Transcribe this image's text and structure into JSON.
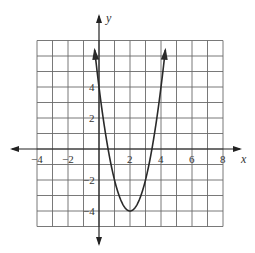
{
  "chart_data": {
    "type": "line",
    "title": "",
    "xlabel": "x",
    "ylabel": "y",
    "xlim": [
      -4,
      8
    ],
    "ylim": [
      -5,
      7
    ],
    "grid": true,
    "x_ticks": [
      -4,
      -2,
      2,
      4,
      6,
      8
    ],
    "y_ticks": [
      4,
      2,
      -2,
      -4
    ],
    "x_tick_labels": [
      "−4",
      "−2",
      "2",
      "4",
      "6",
      "8"
    ],
    "y_tick_labels": [
      "4",
      "2",
      "−2",
      "−4"
    ],
    "series": [
      {
        "name": "y = 2(x - 2)^2 - 4",
        "x": [
          0.15,
          0.5,
          1,
          1.5,
          2,
          2.5,
          3,
          3.5,
          3.85
        ],
        "values": [
          2.85,
          0.5,
          -2,
          -3.5,
          -4,
          -3.5,
          -2,
          0.5,
          2.85
        ],
        "vertex": [
          2,
          -4
        ],
        "y_intercept": 4,
        "passes_through": [
          [
            0,
            4
          ],
          [
            4,
            4
          ],
          [
            2,
            -4
          ]
        ],
        "color": "#333333"
      }
    ],
    "line_color": "#333333",
    "grid_color": "#555555"
  },
  "labels": {
    "x_axis": "x",
    "y_axis": "y",
    "xt0": "−4",
    "xt1": "−2",
    "xt2": "2",
    "xt3": "4",
    "xt4": "6",
    "xt5": "8",
    "yt0": "4",
    "yt1": "2",
    "yt2": "−2",
    "yt3": "−4"
  }
}
